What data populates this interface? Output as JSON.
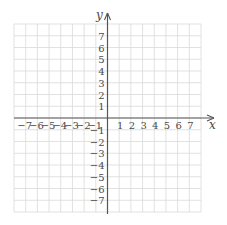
{
  "chart_data": {
    "type": "scatter",
    "title": "",
    "xlabel": "x",
    "ylabel": "y",
    "xlim": [
      -8,
      8
    ],
    "ylim": [
      -8,
      8
    ],
    "grid": true,
    "x_ticks": [
      -7,
      -6,
      -5,
      -4,
      -3,
      -2,
      -1,
      1,
      2,
      3,
      4,
      5,
      6,
      7
    ],
    "y_ticks": [
      -7,
      -6,
      -5,
      -4,
      -3,
      -2,
      -1,
      1,
      2,
      3,
      4,
      5,
      6,
      7
    ],
    "x_tick_labels": [
      "−7",
      "−6",
      "−5",
      "−4",
      "−3",
      "−2",
      "−1",
      "1",
      "2",
      "3",
      "4",
      "5",
      "6",
      "7"
    ],
    "y_tick_labels": [
      "−7",
      "−6",
      "−5",
      "−4",
      "−3",
      "−2",
      "−1",
      "1",
      "2",
      "3",
      "4",
      "5",
      "6",
      "7"
    ],
    "series": [],
    "legend": null
  },
  "colors": {
    "grid": "#d9d9d9",
    "axis": "#555555",
    "text": "#4a4a4a"
  }
}
